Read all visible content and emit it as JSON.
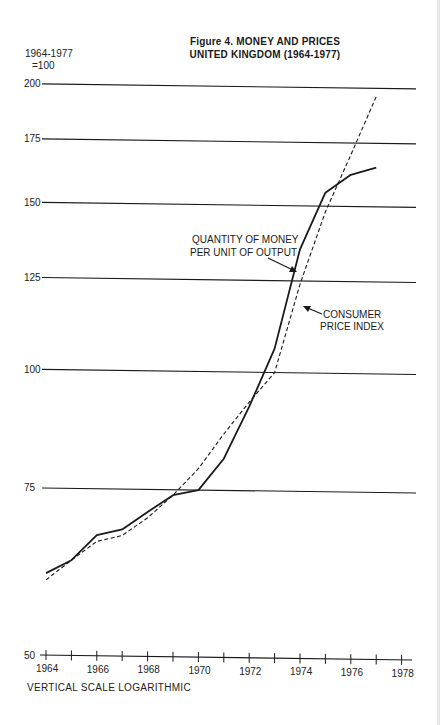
{
  "figure": {
    "title_line1": "Figure 4. MONEY AND PRICES",
    "title_line2": "UNITED KINGDOM (1964-1977)",
    "base_line1": "1964-1977",
    "base_line2": "=100",
    "note": "VERTICAL SCALE LOGARITHMIC"
  },
  "annotations": {
    "money_line1": "QUANTITY OF MONEY",
    "money_line2": "PER UNIT OF OUTPUT",
    "cpi_line1": "CONSUMER",
    "cpi_line2": "PRICE INDEX"
  },
  "chart_data": {
    "type": "line",
    "xlabel": "",
    "ylabel": "1964-1977 =100",
    "y_scale": "log",
    "ylim": [
      50,
      200
    ],
    "yticks": [
      50,
      75,
      100,
      125,
      150,
      175,
      200
    ],
    "xticks": [
      1964,
      1965,
      1966,
      1967,
      1968,
      1969,
      1970,
      1971,
      1972,
      1973,
      1974,
      1975,
      1976,
      1977,
      1978
    ],
    "xtick_labels": [
      "1964",
      "1966",
      "1968",
      "1970",
      "1972",
      "1974",
      "1976",
      "1978"
    ],
    "xlim": [
      1964,
      1978
    ],
    "grid": "horizontal",
    "legend": "none (inline annotations)",
    "note": "VERTICAL SCALE LOGARITHMIC",
    "x": [
      1964,
      1965,
      1966,
      1967,
      1968,
      1969,
      1970,
      1971,
      1972,
      1973,
      1974,
      1975,
      1976,
      1977
    ],
    "series": [
      {
        "name": "QUANTITY OF MONEY PER UNIT OF OUTPUT",
        "style": "solid",
        "values": [
          61,
          63,
          67,
          68,
          71,
          74,
          75,
          81,
          92,
          106,
          135,
          155,
          162,
          165
        ]
      },
      {
        "name": "CONSUMER PRICE INDEX",
        "style": "dashed",
        "values": [
          60,
          63,
          66,
          67,
          70,
          74,
          79,
          86,
          93,
          100,
          124,
          148,
          170,
          196
        ]
      }
    ]
  },
  "layout": {
    "x0": 46,
    "x_per_year": 25.4,
    "y_at_50": 655,
    "px_per_ln": 412,
    "tilt_per_px": 0.0135,
    "grid_x_start": 42,
    "grid_x_end": 416,
    "ink": "#1a1a1a"
  }
}
